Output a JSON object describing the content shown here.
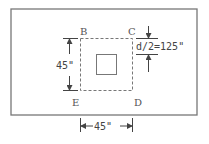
{
  "diagram": {
    "title": "",
    "corner_labels": {
      "B": "B",
      "C": "C",
      "D": "D",
      "E": "E"
    },
    "dimensions": {
      "vertical_side": "45\"",
      "horizontal_side": "45\"",
      "offset": "d/2=125\""
    },
    "colors": {
      "background": "#ffffff",
      "stroke": "#666666",
      "text": "#555555"
    },
    "elements": [
      {
        "id": "slab-outline",
        "type": "rect",
        "style": "solid"
      },
      {
        "id": "critical-perimeter",
        "type": "rect",
        "style": "dashed",
        "corners": [
          "B",
          "C",
          "D",
          "E"
        ]
      },
      {
        "id": "column",
        "type": "rect",
        "style": "solid"
      }
    ]
  }
}
